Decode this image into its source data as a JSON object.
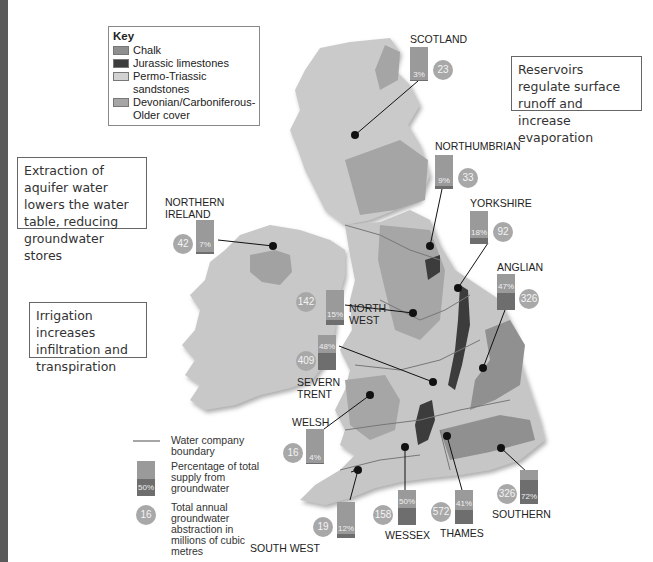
{
  "key": {
    "title": "Key",
    "items": [
      {
        "label": "Chalk",
        "color": "#8f8f8f"
      },
      {
        "label": "Jurassic limestones",
        "color": "#3c3c3c"
      },
      {
        "label": "Permo-Triassic sandstones",
        "color": "#d2d2d2"
      },
      {
        "label": "Devonian/Carboniferous-Older cover",
        "color": "#a6a6a6"
      }
    ]
  },
  "annotations": {
    "reservoirs": "Reservoirs regulate surface runoff and increase evaporation",
    "extraction": "Extraction of aquifer water lowers the water table, reducing groundwater stores",
    "irrigation": "Irrigation increases infiltration and transpiration"
  },
  "regions": [
    {
      "name": "SCOTLAND",
      "percent": "3%",
      "abstraction": "23"
    },
    {
      "name": "NORTHUMBRIAN",
      "percent": "9%",
      "abstraction": "33"
    },
    {
      "name": "YORKSHIRE",
      "percent": "18%",
      "abstraction": "92"
    },
    {
      "name": "ANGLIAN",
      "percent": "47%",
      "abstraction": "326"
    },
    {
      "name": "NORTHERN IRELAND",
      "percent": "7%",
      "abstraction": "42"
    },
    {
      "name": "NORTH WEST",
      "percent": "15%",
      "abstraction": "142"
    },
    {
      "name": "SEVERN TRENT",
      "percent": "48%",
      "abstraction": "409"
    },
    {
      "name": "WELSH",
      "percent": "4%",
      "abstraction": "16"
    },
    {
      "name": "SOUTH WEST",
      "percent": "12%",
      "abstraction": "19"
    },
    {
      "name": "WESSEX",
      "percent": "50%",
      "abstraction": "158"
    },
    {
      "name": "THAMES",
      "percent": "41%",
      "abstraction": "572"
    },
    {
      "name": "SOUTHERN",
      "percent": "72%",
      "abstraction": "326"
    }
  ],
  "legend": {
    "boundary": "Water company boundary",
    "percentage": "Percentage of total supply from groundwater",
    "percentage_example": "50%",
    "abstraction": "Total annual groundwater abstraction in millions of cubic metres",
    "abstraction_example": "16"
  }
}
